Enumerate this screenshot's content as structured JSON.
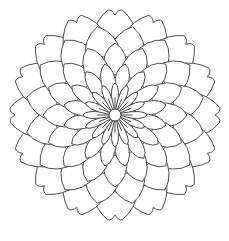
{
  "image": {
    "description": "Black-and-white line-art mandala coloring page with layered pointed petals around a small central circle",
    "background_color": "#ffffff",
    "line_color": "#3a3a3a"
  },
  "mandala": {
    "center": [
      115,
      115
    ],
    "outer_radius": 105,
    "center_circle_radius": 6,
    "symmetry": 16,
    "rings": [
      {
        "name": "inner-petals",
        "count": 16,
        "inner_r": 6,
        "outer_r": 32
      },
      {
        "name": "second-ring",
        "count": 16,
        "inner_r": 22,
        "outer_r": 52
      },
      {
        "name": "third-ring",
        "count": 16,
        "inner_r": 42,
        "outer_r": 72
      },
      {
        "name": "fourth-ring",
        "count": 16,
        "inner_r": 62,
        "outer_r": 90
      },
      {
        "name": "outer-ring",
        "count": 16,
        "inner_r": 80,
        "outer_r": 105
      }
    ]
  }
}
